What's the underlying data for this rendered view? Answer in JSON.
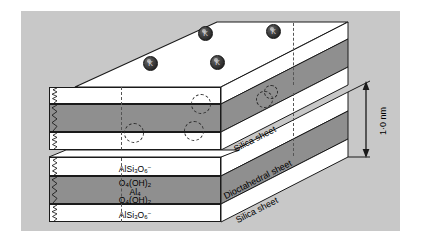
{
  "figure": {
    "kind": "crystal-structure-diagram",
    "background_color": "#c8c8c8",
    "page_color": "#ffffff",
    "sheet_white_color": "#ffffff",
    "sheet_gray_color": "#8f8f8f",
    "outline_color": "#1a1a1a"
  },
  "interlayer_ions": {
    "label": "K",
    "symbol": "K",
    "count": 4,
    "color": "#2b2b2b",
    "positions": [
      {
        "x": 198,
        "y": 26
      },
      {
        "x": 266,
        "y": 24
      },
      {
        "x": 143,
        "y": 56
      },
      {
        "x": 210,
        "y": 55
      }
    ]
  },
  "ion_site_circles": {
    "name": "dashed-ion-site",
    "count": 5,
    "positions": [
      {
        "x": 193,
        "y": 120,
        "d": 20
      },
      {
        "x": 200,
        "y": 93,
        "d": 20
      },
      {
        "x": 133,
        "y": 122,
        "d": 20
      },
      {
        "x": 262,
        "y": 95,
        "d": 16
      },
      {
        "x": 268,
        "y": 89,
        "d": 14
      }
    ]
  },
  "upper_block": {
    "name": "upper-crystal-block",
    "layers": [
      {
        "name": "silica-sheet-top",
        "fill": "white",
        "formula_html": ""
      },
      {
        "name": "dioctahedral-sheet",
        "fill": "gray",
        "formula_html": ""
      },
      {
        "name": "silica-sheet-bottom",
        "fill": "white",
        "formula_html": ""
      }
    ]
  },
  "lower_block": {
    "name": "lower-crystal-block",
    "layers": [
      {
        "name": "silica-sheet-upper",
        "fill": "white",
        "formula_html": "AlSi<sub>3</sub>O<sub>6</sub><sup>&minus;</sup>",
        "formula_plain": "AlSi3O6-"
      },
      {
        "name": "dioctahedral-sheet",
        "fill": "gray",
        "formula_lines_html": [
          "O<sub>4</sub>(OH)<sub>2</sub>",
          "Al<sub>4</sub>",
          "O<sub>4</sub>(OH)<sub>2</sub>"
        ],
        "formula_lines_plain": [
          "O4(OH)2",
          "Al4",
          "O4(OH)2"
        ]
      },
      {
        "name": "silica-sheet-lower",
        "fill": "white",
        "formula_html": "AlSi<sub>3</sub>O<sub>6</sub><sup>&minus;</sup>",
        "formula_plain": "AlSi3O6-"
      }
    ]
  },
  "side_labels": [
    {
      "name": "silica-sheet-label-upper",
      "text": "Silica sheet"
    },
    {
      "name": "dioctahedral-sheet-label",
      "text": "Dioctahedral sheet"
    },
    {
      "name": "silica-sheet-label-lower",
      "text": "Silica sheet"
    }
  ],
  "dimension": {
    "name": "layer-thickness-dimension",
    "text": "1·0 nm",
    "value": 1.0,
    "unit": "nm"
  }
}
